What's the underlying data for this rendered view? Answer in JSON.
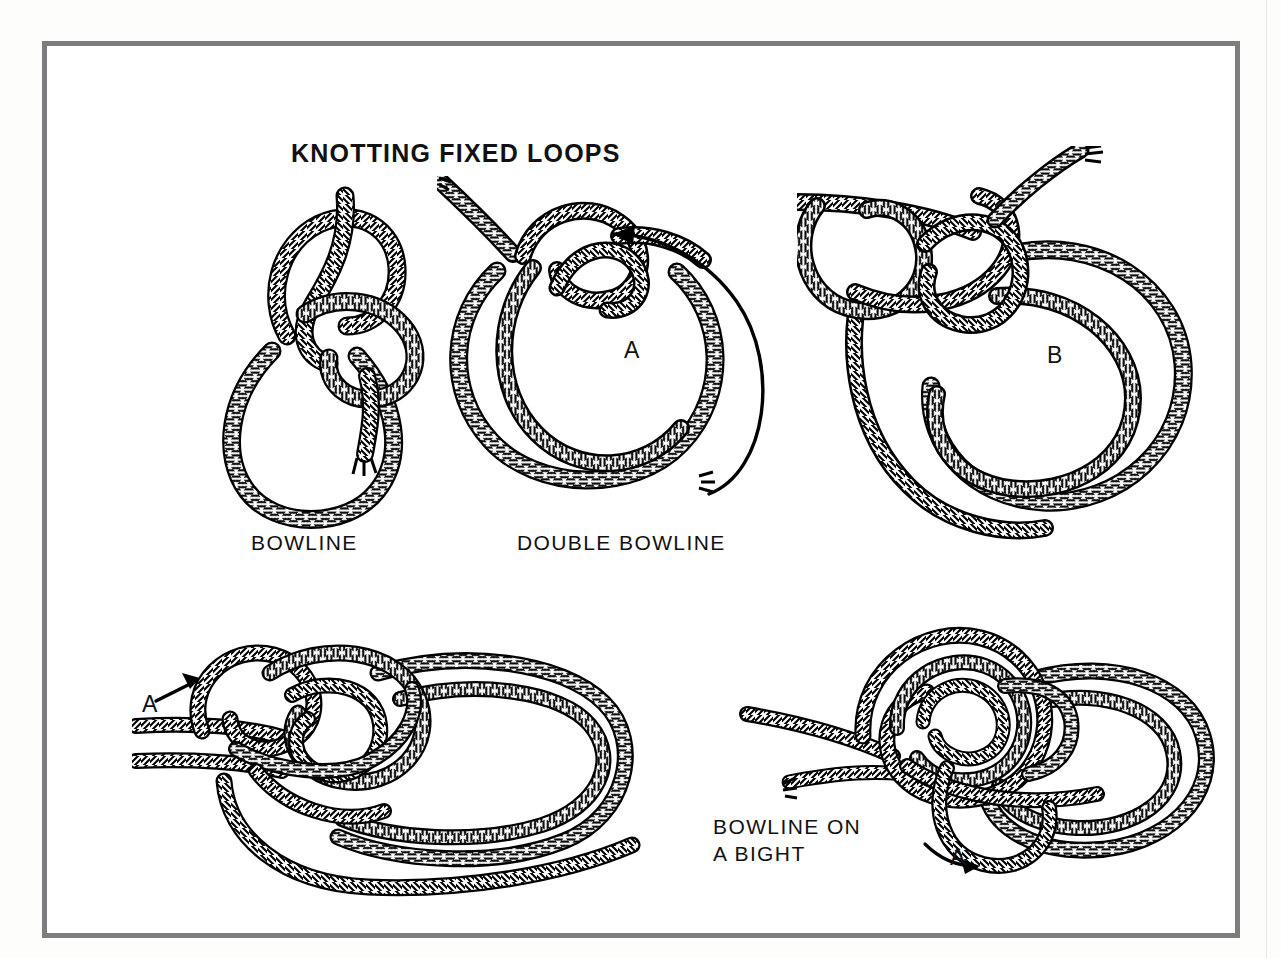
{
  "page": {
    "background_color": "#fdfdfc",
    "scan_artifact_top_text": "",
    "frame": {
      "border_color": "#7d7d7d",
      "fill_color": "#ffffff"
    }
  },
  "plate": {
    "title": "KNOTTING FIXED LOOPS",
    "title_color": "#111111",
    "ink_color": "#000000"
  },
  "figures": [
    {
      "id": "bowline",
      "caption": "BOWLINE",
      "markers": []
    },
    {
      "id": "double-bowline",
      "caption": "DOUBLE BOWLINE",
      "markers": [
        "A"
      ],
      "annotation": "circular arrow counter-clockwise"
    },
    {
      "id": "double-bowline-step-b",
      "caption": "",
      "markers": [
        "B"
      ]
    },
    {
      "id": "bowline-on-a-bight-step-1",
      "caption": "",
      "markers": [
        "A"
      ],
      "annotation": "straight arrow pointing up-right"
    },
    {
      "id": "bowline-on-a-bight-step-2",
      "caption": "BOWLINE ON\nA BIGHT",
      "markers": [
        "A"
      ],
      "annotation": "curved arrow pointing right"
    }
  ],
  "captions": {
    "bowline": "BOWLINE",
    "double_bowline": "DOUBLE BOWLINE",
    "bowline_on_a_bight": "BOWLINE ON\nA BIGHT"
  },
  "markers": {
    "a_double_bowline": "A",
    "b_double_bowline": "B",
    "a_bight_step1": "A",
    "a_bight_step2": "A"
  }
}
